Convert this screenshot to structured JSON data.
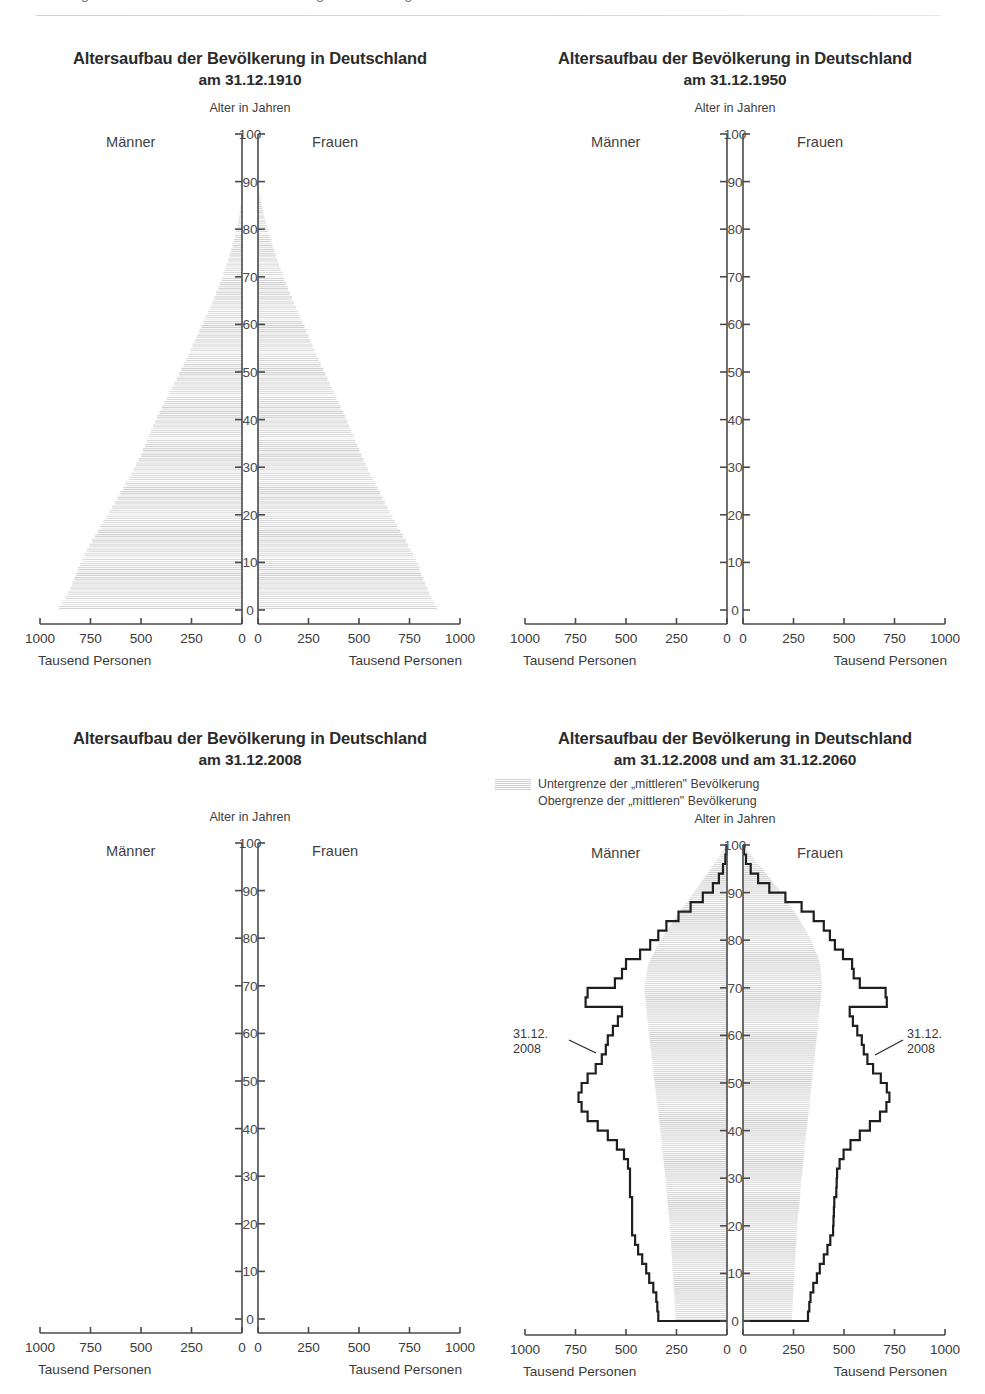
{
  "header": {
    "cut_text": "Demografischer Wandel und Bevölkerungsentwicklung"
  },
  "labels": {
    "men": "Männer",
    "women": "Frauen",
    "age_axis_title": "Alter in Jahren",
    "unit": "Tausend Personen",
    "zero_center": "0"
  },
  "xticks": [
    "1000",
    "750",
    "500",
    "250",
    "0"
  ],
  "xticks_right": [
    "0",
    "250",
    "500",
    "750",
    "1000"
  ],
  "yticks": [
    "0",
    "10",
    "20",
    "30",
    "40",
    "50",
    "60",
    "70",
    "80",
    "90",
    "100"
  ],
  "panels": [
    {
      "id": "pyramid-1910",
      "title": "Altersaufbau der Bevölkerung in Deutschland",
      "subtitle": "am 31.12.1910"
    },
    {
      "id": "pyramid-1950",
      "title": "Altersaufbau der Bevölkerung in Deutschland",
      "subtitle": "am 31.12.1950"
    },
    {
      "id": "pyramid-2008",
      "title": "Altersaufbau der Bevölkerung in Deutschland",
      "subtitle": "am 31.12.2008"
    },
    {
      "id": "pyramid-2008-2060",
      "title": "Altersaufbau der Bevölkerung in Deutschland",
      "subtitle": "am 31.12.2008 und am 31.12.2060",
      "legend": [
        "Untergrenze der „mittleren\" Bevölkerung",
        "Obergrenze der „mittleren\" Bevölkerung"
      ],
      "annotation_left_line1": "31.12.",
      "annotation_left_line2": "2008",
      "annotation_right_line1": "31.12.",
      "annotation_right_line2": "2008"
    }
  ],
  "colors": {
    "ink": "#2b2b2b",
    "axis": "#4a4a4a",
    "hatch": "#c9c9c9",
    "outline": "#1f1f1f",
    "rule": "#d4d4d4"
  },
  "chart_data": [
    {
      "type": "bar",
      "title": "Altersaufbau der Bevölkerung in Deutschland am 31.12.1910",
      "orientation": "population-pyramid",
      "xlabel": "Tausend Personen",
      "ylabel": "Alter in Jahren",
      "xlim": [
        0,
        1000
      ],
      "ylim": [
        0,
        100
      ],
      "grid": false,
      "series": [
        {
          "name": "Männer",
          "side": "left",
          "ages": [
            0,
            1,
            2,
            3,
            4,
            5,
            6,
            7,
            8,
            9,
            10,
            11,
            12,
            13,
            14,
            15,
            16,
            17,
            18,
            19,
            20,
            21,
            22,
            23,
            24,
            25,
            26,
            27,
            28,
            29,
            30,
            31,
            32,
            33,
            34,
            35,
            36,
            37,
            38,
            39,
            40,
            41,
            42,
            43,
            44,
            45,
            46,
            47,
            48,
            49,
            50,
            51,
            52,
            53,
            54,
            55,
            56,
            57,
            58,
            59,
            60,
            61,
            62,
            63,
            64,
            65,
            66,
            67,
            68,
            69,
            70,
            71,
            72,
            73,
            74,
            75,
            76,
            77,
            78,
            79,
            80,
            81,
            82,
            83,
            84,
            85,
            86,
            87,
            88,
            89,
            90
          ],
          "values": [
            905,
            890,
            875,
            862,
            850,
            840,
            830,
            820,
            812,
            802,
            792,
            780,
            768,
            755,
            742,
            728,
            714,
            700,
            686,
            672,
            658,
            644,
            630,
            616,
            602,
            588,
            574,
            560,
            548,
            536,
            524,
            512,
            500,
            490,
            480,
            470,
            460,
            450,
            440,
            430,
            420,
            408,
            396,
            384,
            372,
            360,
            348,
            336,
            324,
            312,
            300,
            289,
            278,
            267,
            256,
            245,
            234,
            223,
            212,
            201,
            190,
            179,
            168,
            158,
            148,
            138,
            128,
            118,
            109,
            100,
            92,
            84,
            76,
            68,
            61,
            54,
            47,
            41,
            35,
            29,
            24,
            19,
            15,
            11,
            8,
            5,
            3,
            2,
            1,
            0,
            0
          ]
        },
        {
          "name": "Frauen",
          "side": "right",
          "ages": [
            0,
            1,
            2,
            3,
            4,
            5,
            6,
            7,
            8,
            9,
            10,
            11,
            12,
            13,
            14,
            15,
            16,
            17,
            18,
            19,
            20,
            21,
            22,
            23,
            24,
            25,
            26,
            27,
            28,
            29,
            30,
            31,
            32,
            33,
            34,
            35,
            36,
            37,
            38,
            39,
            40,
            41,
            42,
            43,
            44,
            45,
            46,
            47,
            48,
            49,
            50,
            51,
            52,
            53,
            54,
            55,
            56,
            57,
            58,
            59,
            60,
            61,
            62,
            63,
            64,
            65,
            66,
            67,
            68,
            69,
            70,
            71,
            72,
            73,
            74,
            75,
            76,
            77,
            78,
            79,
            80,
            81,
            82,
            83,
            84,
            85,
            86,
            87,
            88,
            89,
            90
          ],
          "values": [
            885,
            872,
            860,
            848,
            838,
            828,
            818,
            808,
            800,
            790,
            780,
            768,
            756,
            744,
            732,
            718,
            704,
            690,
            678,
            665,
            652,
            640,
            628,
            616,
            604,
            592,
            580,
            568,
            556,
            545,
            534,
            523,
            512,
            502,
            492,
            482,
            472,
            462,
            452,
            442,
            432,
            421,
            410,
            399,
            388,
            377,
            366,
            355,
            344,
            333,
            322,
            311,
            300,
            290,
            280,
            270,
            260,
            250,
            240,
            230,
            220,
            209,
            198,
            188,
            178,
            168,
            158,
            148,
            139,
            130,
            121,
            112,
            104,
            96,
            88,
            80,
            72,
            65,
            58,
            51,
            44,
            38,
            32,
            26,
            21,
            16,
            12,
            8,
            5,
            2,
            0
          ]
        }
      ]
    },
    {
      "type": "bar",
      "title": "Altersaufbau der Bevölkerung in Deutschland am 31.12.1950",
      "orientation": "population-pyramid",
      "xlabel": "Tausend Personen",
      "ylabel": "Alter in Jahren",
      "xlim": [
        0,
        1000
      ],
      "ylim": [
        0,
        100
      ],
      "grid": false,
      "note": "Data fill is faded/near-invisible in this reproduction; only the axes are legible.",
      "series": [
        {
          "name": "Männer",
          "side": "left",
          "ages": [],
          "values": []
        },
        {
          "name": "Frauen",
          "side": "right",
          "ages": [],
          "values": []
        }
      ]
    },
    {
      "type": "bar",
      "title": "Altersaufbau der Bevölkerung in Deutschland am 31.12.2008",
      "orientation": "population-pyramid",
      "xlabel": "Tausend Personen",
      "ylabel": "Alter in Jahren",
      "xlim": [
        0,
        1000
      ],
      "ylim": [
        0,
        100
      ],
      "grid": false,
      "note": "Data fill is faded/near-invisible in this reproduction; only the axes are legible.",
      "series": [
        {
          "name": "Männer",
          "side": "left",
          "ages": [],
          "values": []
        },
        {
          "name": "Frauen",
          "side": "right",
          "ages": [],
          "values": []
        }
      ]
    },
    {
      "type": "area",
      "title": "Altersaufbau der Bevölkerung in Deutschland am 31.12.2008 und am 31.12.2060",
      "orientation": "population-pyramid",
      "xlabel": "Tausend Personen",
      "ylabel": "Alter in Jahren",
      "xlim": [
        0,
        1000
      ],
      "ylim": [
        0,
        100
      ],
      "grid": false,
      "legend_position": "above-plot",
      "legend": [
        "Untergrenze der „mittleren\" Bevölkerung",
        "Obergrenze der „mittleren\" Bevölkerung"
      ],
      "annotations": [
        {
          "text": "31.12.\n2008",
          "side": "left",
          "age": 46
        },
        {
          "text": "31.12.\n2008",
          "side": "right",
          "age": 46
        }
      ],
      "series": [
        {
          "name": "Männer 31.12.2008",
          "side": "left",
          "style": "outline",
          "ages": [
            0,
            2,
            4,
            6,
            8,
            10,
            12,
            14,
            16,
            18,
            20,
            22,
            24,
            26,
            28,
            30,
            32,
            34,
            36,
            38,
            40,
            42,
            44,
            46,
            48,
            50,
            52,
            54,
            56,
            58,
            60,
            62,
            64,
            66,
            68,
            70,
            72,
            74,
            76,
            78,
            80,
            82,
            84,
            86,
            88,
            90,
            92,
            94,
            96,
            98,
            100
          ],
          "values": [
            340,
            345,
            350,
            365,
            385,
            400,
            420,
            440,
            455,
            470,
            470,
            470,
            470,
            480,
            480,
            480,
            490,
            510,
            545,
            590,
            640,
            690,
            720,
            735,
            720,
            690,
            650,
            620,
            600,
            590,
            565,
            540,
            520,
            700,
            690,
            555,
            520,
            500,
            430,
            380,
            340,
            300,
            240,
            180,
            120,
            70,
            40,
            20,
            8,
            3,
            0
          ]
        },
        {
          "name": "Frauen 31.12.2008",
          "side": "right",
          "style": "outline",
          "ages": [
            0,
            2,
            4,
            6,
            8,
            10,
            12,
            14,
            16,
            18,
            20,
            22,
            24,
            26,
            28,
            30,
            32,
            34,
            36,
            38,
            40,
            42,
            44,
            46,
            48,
            50,
            52,
            54,
            56,
            58,
            60,
            62,
            64,
            66,
            68,
            70,
            72,
            74,
            76,
            78,
            80,
            82,
            84,
            86,
            88,
            90,
            92,
            94,
            96,
            98,
            100
          ],
          "values": [
            322,
            328,
            334,
            348,
            366,
            380,
            400,
            418,
            432,
            446,
            448,
            450,
            452,
            462,
            464,
            466,
            478,
            498,
            532,
            578,
            628,
            678,
            710,
            725,
            712,
            682,
            644,
            616,
            598,
            588,
            566,
            544,
            528,
            712,
            706,
            578,
            548,
            540,
            495,
            455,
            430,
            400,
            350,
            290,
            210,
            130,
            75,
            38,
            15,
            5,
            0
          ]
        },
        {
          "name": "Untergrenze der „mittleren\" Bevölkerung 2060",
          "side": "left",
          "style": "hatched-band",
          "ages": [
            0,
            5,
            10,
            15,
            20,
            25,
            30,
            35,
            40,
            45,
            50,
            55,
            60,
            65,
            70,
            75,
            80,
            85,
            90,
            95,
            100
          ],
          "values": [
            255,
            260,
            268,
            275,
            282,
            295,
            305,
            318,
            330,
            345,
            358,
            372,
            385,
            398,
            410,
            390,
            330,
            250,
            165,
            80,
            0
          ]
        },
        {
          "name": "Untergrenze der „mittleren\" Bevölkerung 2060",
          "side": "right",
          "style": "hatched-band",
          "ages": [
            0,
            5,
            10,
            15,
            20,
            25,
            30,
            35,
            40,
            45,
            50,
            55,
            60,
            65,
            70,
            75,
            80,
            85,
            90,
            95,
            100
          ],
          "values": [
            242,
            247,
            254,
            261,
            268,
            280,
            290,
            302,
            314,
            328,
            340,
            354,
            366,
            378,
            392,
            382,
            340,
            270,
            190,
            95,
            0
          ]
        }
      ]
    }
  ]
}
